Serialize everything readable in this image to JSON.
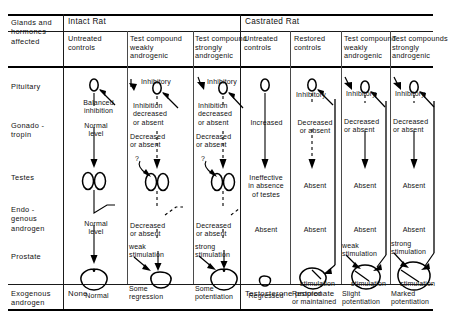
{
  "title_cell": "Glands and\nhormones\naffected",
  "groups": [
    {
      "name": "intact",
      "label": "Intact Rat"
    },
    {
      "name": "castrated",
      "label": "Castrated Rat"
    }
  ],
  "columns": [
    {
      "key": "untreated_intact",
      "header": "Untreated\ncontrols"
    },
    {
      "key": "weak_intact",
      "header": "Test compound\nweakly\nandrogenic"
    },
    {
      "key": "strong_intact",
      "header": "Test compound\nstrongly\nandrogenic"
    },
    {
      "key": "untreated_castr",
      "header": "Untreated\ncontrols"
    },
    {
      "key": "restored_castr",
      "header": "Restored\ncontrols"
    },
    {
      "key": "weak_castr",
      "header": "Test compound\nweakly\nandrogenic"
    },
    {
      "key": "strong_castr",
      "header": "Test compounds\nstrongly\nandrogenic"
    }
  ],
  "rows": [
    {
      "key": "pituitary",
      "label": "Pituitary"
    },
    {
      "key": "gonadotropin",
      "label": "Gonado -\ntropin"
    },
    {
      "key": "testes",
      "label": "Testes"
    },
    {
      "key": "endogenous",
      "label": "Endo -\ngenous\nandrogen"
    },
    {
      "key": "prostate",
      "label": "Prostate"
    },
    {
      "key": "exogenous",
      "label": "Exogenous\nandrogen"
    }
  ],
  "annotations": {
    "untreated_intact": {
      "pituitary_feedback": "Balanced\ninhibition",
      "gonadotropin": "Normal\nlevel",
      "endogenous": "Normal\nlevel",
      "prostate": "Normal"
    },
    "weak_intact": {
      "arrow_in": "Inhibitory",
      "pituitary_feedback": "Inhibition\ndecreased\nor absent",
      "gonadotropin": "Decreased\nor absent",
      "testes_query": "?",
      "endogenous": "Decreased\nor absent",
      "stimulation": "weak\nstimulation",
      "prostate": "Some\nregression"
    },
    "strong_intact": {
      "arrow_in": "Inhibitory",
      "pituitary_feedback": "Inhibition\ndecreased\nor absent",
      "gonadotropin": "Decreased\nor absent",
      "testes_query": "?",
      "endogenous": "Decreased\nor absent",
      "stimulation": "strong\nstimulation",
      "prostate": "Some\npotentiation"
    },
    "untreated_castr": {
      "gonadotropin": "Increased",
      "testes": "Ineffective\nin absence\nof testes",
      "endogenous": "Absent",
      "prostate": "Regressed"
    },
    "restored_castr": {
      "arrow_in": "Inhibitory",
      "gonadotropin": "Decreased\nor absent",
      "testes": "Absent",
      "endogenous": "Absent",
      "stimulation": "stimulation",
      "prostate": "Restored\nor maintained"
    },
    "weak_castr": {
      "arrow_in": "Inhibitory",
      "gonadotropin": "Decreased\nor absent",
      "testes": "Absent",
      "endogenous": "Absent",
      "pre_stimulation": "weak\nstimulation",
      "stimulation": "stimulation",
      "prostate": "Slight\npotentiation"
    },
    "strong_castr": {
      "arrow_in": "Inhibitory",
      "gonadotropin": "Decreased\nor absent",
      "testes": "Absent",
      "endogenous": "Absent",
      "pre_stimulation": "strong\nstimulation",
      "stimulation": "stimulation",
      "prostate": "Marked\npotentiation"
    }
  },
  "exogenous_row": {
    "intact_value": "None",
    "castrated_value": "Testosterone propionate"
  },
  "colors": {
    "ink": "#111111",
    "rule": "#1a1a1a",
    "background": "#ffffff"
  }
}
